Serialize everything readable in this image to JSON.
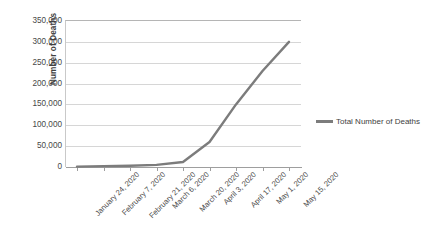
{
  "chart_data": {
    "type": "line",
    "title": "",
    "xlabel": "",
    "ylabel": "Number of Deaths",
    "ylim": [
      0,
      350000
    ],
    "ytick_step": 50000,
    "grid": true,
    "legend_position": "right",
    "line_color": "#7c7c7c",
    "gridline_color": "#d6d6d6",
    "y_tick_labels": [
      "350,000",
      "300,000",
      "250,000",
      "200,000",
      "150,000",
      "100,000",
      "50,000",
      "0"
    ],
    "y_tick_values": [
      350000,
      300000,
      250000,
      200000,
      150000,
      100000,
      50000,
      0
    ],
    "categories": [
      "January 24, 2020",
      "February 7, 2020",
      "February 21, 2020",
      "March 6, 2020",
      "March 20, 2020",
      "April 3, 2020",
      "April 17, 2020",
      "May 1, 2020",
      "May 15, 2020"
    ],
    "series": [
      {
        "name": "Total Number of Deaths",
        "values": [
          1000,
          2000,
          3000,
          5000,
          12000,
          60000,
          150000,
          230000,
          300000
        ]
      }
    ],
    "legend": [
      "Total Number of Deaths"
    ]
  }
}
